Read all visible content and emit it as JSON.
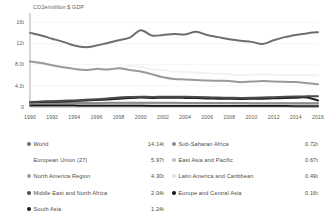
{
  "chart_data": {
    "type": "line",
    "title": "CO2e/million $ GDP",
    "xlabel": "",
    "ylabel": "CO2e/million $ GDP",
    "grid": true,
    "legend_position": "bottom",
    "xlim": [
      1990,
      2016
    ],
    "ylim": [
      0,
      17
    ],
    "x": [
      1990,
      1991,
      1992,
      1993,
      1994,
      1995,
      1996,
      1997,
      1998,
      1999,
      2000,
      2001,
      2002,
      2003,
      2004,
      2005,
      2006,
      2007,
      2008,
      2009,
      2010,
      2011,
      2012,
      2013,
      2014,
      2015,
      2016
    ],
    "xticks": [
      "1990",
      "1992",
      "1994",
      "1996",
      "1998",
      "2000",
      "2002",
      "2004",
      "2006",
      "2008",
      "2010",
      "2012",
      "2014",
      "2016"
    ],
    "yticks": [
      "0",
      "4.0t",
      "8.0t",
      "12t",
      "16t"
    ],
    "ytick_values": [
      0,
      4,
      8,
      12,
      16
    ],
    "series": [
      {
        "name": "World",
        "color": "#6e6e6e",
        "end_value": "14.14t",
        "values": [
          14.0,
          13.5,
          12.9,
          12.3,
          11.6,
          11.3,
          11.6,
          12.1,
          12.6,
          13.1,
          14.5,
          13.5,
          13.6,
          13.8,
          13.7,
          14.2,
          13.6,
          13.2,
          12.8,
          12.5,
          12.3,
          11.9,
          12.6,
          13.2,
          13.6,
          13.9,
          14.14
        ]
      },
      {
        "name": "European Union (27)",
        "color": "#f2f2f2",
        "end_value": "5.97t",
        "values": [
          8.6,
          8.3,
          7.9,
          7.5,
          7.2,
          7.0,
          7.2,
          7.1,
          7.2,
          7.8,
          7.5,
          7.1,
          7.0,
          6.7,
          6.6,
          6.5,
          6.4,
          6.3,
          6.2,
          6.0,
          6.1,
          6.2,
          6.1,
          6.05,
          6.0,
          5.99,
          5.97
        ]
      },
      {
        "name": "North America Region",
        "color": "#9a9a9a",
        "end_value": "4.30t",
        "values": [
          8.6,
          8.3,
          7.9,
          7.5,
          7.2,
          7.0,
          7.2,
          7.1,
          7.3,
          7.0,
          6.7,
          6.2,
          5.6,
          5.3,
          5.2,
          5.1,
          5.0,
          4.95,
          4.9,
          4.7,
          4.8,
          4.9,
          4.8,
          4.75,
          4.7,
          4.5,
          4.3
        ]
      },
      {
        "name": "Middle East and North Africa",
        "color": "#4b4b4b",
        "end_value": "2.04t",
        "values": [
          0.95,
          1.02,
          1.1,
          1.18,
          1.25,
          1.35,
          1.48,
          1.6,
          1.78,
          1.88,
          1.95,
          1.9,
          1.93,
          1.95,
          1.92,
          1.88,
          1.82,
          1.78,
          1.75,
          1.72,
          1.73,
          1.78,
          1.85,
          1.92,
          1.98,
          2.01,
          2.04
        ]
      },
      {
        "name": "South Asia",
        "color": "#1f1f1f",
        "end_value": "1.24t",
        "values": [
          0.9,
          0.95,
          1.0,
          1.06,
          1.13,
          1.22,
          1.32,
          1.44,
          1.58,
          1.7,
          1.78,
          1.72,
          1.74,
          1.75,
          1.72,
          1.68,
          1.62,
          1.58,
          1.55,
          1.52,
          1.54,
          1.58,
          1.64,
          1.7,
          1.76,
          1.8,
          1.24
        ]
      },
      {
        "name": "Sub-Saharan Africa",
        "color": "#8c8c8c",
        "end_value": "0.72t",
        "values": [
          0.72,
          0.73,
          0.74,
          0.74,
          0.75,
          0.76,
          0.77,
          0.78,
          0.79,
          0.8,
          0.82,
          0.8,
          0.79,
          0.78,
          0.77,
          0.76,
          0.75,
          0.75,
          0.74,
          0.74,
          0.73,
          0.73,
          0.73,
          0.72,
          0.72,
          0.72,
          0.72
        ]
      },
      {
        "name": "East Asia and Pacific",
        "color": "#bfbfbf",
        "end_value": "0.67t",
        "values": [
          0.55,
          0.57,
          0.59,
          0.61,
          0.63,
          0.65,
          0.67,
          0.69,
          0.7,
          0.71,
          0.73,
          0.72,
          0.72,
          0.72,
          0.71,
          0.7,
          0.7,
          0.69,
          0.69,
          0.68,
          0.68,
          0.68,
          0.68,
          0.67,
          0.67,
          0.67,
          0.67
        ]
      },
      {
        "name": "Latin America and Caribbean",
        "color": "#e2e2e2",
        "end_value": "0.49t",
        "values": [
          0.44,
          0.45,
          0.45,
          0.46,
          0.46,
          0.47,
          0.48,
          0.48,
          0.49,
          0.5,
          0.51,
          0.5,
          0.5,
          0.5,
          0.5,
          0.49,
          0.49,
          0.49,
          0.49,
          0.48,
          0.49,
          0.49,
          0.49,
          0.49,
          0.49,
          0.49,
          0.49
        ]
      },
      {
        "name": "Europe and Central Asia",
        "color": "#141414",
        "end_value": "0.16t",
        "values": [
          0.3,
          0.29,
          0.28,
          0.27,
          0.26,
          0.25,
          0.25,
          0.24,
          0.23,
          0.22,
          0.22,
          0.21,
          0.21,
          0.2,
          0.2,
          0.19,
          0.19,
          0.19,
          0.18,
          0.18,
          0.18,
          0.17,
          0.17,
          0.17,
          0.16,
          0.16,
          0.16
        ]
      }
    ]
  },
  "chart": {
    "axis_title": "CO2e/million $ GDP",
    "yticks": [
      {
        "label": "16t",
        "value": 16
      },
      {
        "label": "12t",
        "value": 12
      },
      {
        "label": "8.0t",
        "value": 8
      },
      {
        "label": "4.0t",
        "value": 4
      },
      {
        "label": "0",
        "value": 0
      }
    ],
    "xticks": [
      "1990",
      "1992",
      "1994",
      "1996",
      "1998",
      "2000",
      "2002",
      "2004",
      "2006",
      "2008",
      "2010",
      "2012",
      "2014",
      "2016"
    ]
  },
  "legend": {
    "left_column": [
      {
        "label": "World",
        "value": "14.14t",
        "color": "#6e6e6e"
      },
      {
        "label": "European Union (27)",
        "value": "5.97t",
        "color": "#ffffff"
      },
      {
        "label": "North America Region",
        "value": "4.30t",
        "color": "#9a9a9a"
      },
      {
        "label": "Middle East and North Africa",
        "value": "2.04t",
        "color": "#4b4b4b"
      },
      {
        "label": "South Asia",
        "value": "1.24t",
        "color": "#1f1f1f"
      }
    ],
    "right_column": [
      {
        "label": "Sub-Saharan Africa",
        "value": "0.72t",
        "color": "#8c8c8c"
      },
      {
        "label": "East Asia and Pacific",
        "value": "0.67t",
        "color": "#bfbfbf"
      },
      {
        "label": "Latin America and Caribbean",
        "value": "0.49t",
        "color": "#e2e2e2"
      },
      {
        "label": "Europe and Central Asia",
        "value": "0.16t",
        "color": "#141414"
      }
    ]
  },
  "colors": {
    "axis": "#8a8a8a",
    "grid": "#ededed",
    "text": "#4a4a4a",
    "background": "#ffffff"
  }
}
